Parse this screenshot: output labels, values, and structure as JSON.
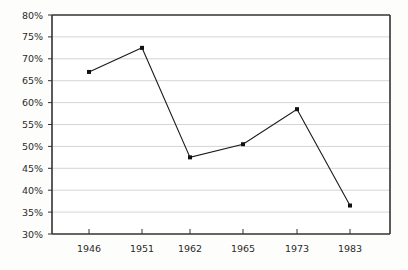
{
  "chart_data": {
    "type": "line",
    "title": "",
    "subtitle": "",
    "xlabel": "",
    "ylabel": "",
    "categories": [
      "1946",
      "1951",
      "1962",
      "1965",
      "1973",
      "1983"
    ],
    "x": [
      "1946",
      "1951",
      "1962",
      "1965",
      "1973",
      "1983"
    ],
    "values": [
      67,
      72.5,
      47.5,
      50.5,
      58.5,
      36.5
    ],
    "series": [
      {
        "name": "",
        "values": [
          67,
          72.5,
          47.5,
          50.5,
          58.5,
          36.5
        ]
      }
    ],
    "ylim": [
      30,
      80
    ],
    "ytick_values": [
      30,
      35,
      40,
      45,
      50,
      55,
      60,
      65,
      70,
      75,
      80
    ],
    "ytick_labels": [
      "30%",
      "35%",
      "40%",
      "45%",
      "50%",
      "55%",
      "60%",
      "65%",
      "70%",
      "75%",
      "80%"
    ],
    "xtick_labels": [
      "1946",
      "1951",
      "1962",
      "1965",
      "1973",
      "1983"
    ],
    "grid": true,
    "grid_axis": "y",
    "legend": false,
    "legend_position": "none",
    "annotations": [],
    "marker": "square",
    "line_color": "#1a1a1a",
    "marker_color": "#111111",
    "grid_color": "#c9c9c9",
    "axis_color": "#333333",
    "background_color": "#fdfdfb"
  },
  "geometry": {
    "plot_left": 52,
    "plot_right": 390,
    "plot_top": 15,
    "plot_bottom": 234,
    "tick_x": [
      89,
      142,
      190,
      243,
      297,
      350
    ]
  }
}
